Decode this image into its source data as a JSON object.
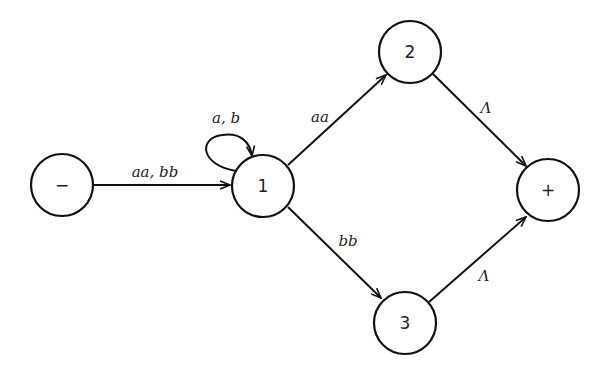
{
  "diagram": {
    "type": "finite automaton / transition graph",
    "nodes": [
      {
        "id": "start",
        "label": "−",
        "role": "start state"
      },
      {
        "id": "s1",
        "label": "1"
      },
      {
        "id": "s2",
        "label": "2"
      },
      {
        "id": "s3",
        "label": "3"
      },
      {
        "id": "final",
        "label": "+",
        "role": "final state"
      }
    ],
    "edges": [
      {
        "from": "start",
        "to": "s1",
        "label": "aa, bb"
      },
      {
        "from": "s1",
        "to": "s1",
        "label": "a, b",
        "loop": true
      },
      {
        "from": "s1",
        "to": "s2",
        "label": "aa"
      },
      {
        "from": "s1",
        "to": "s3",
        "label": "bb"
      },
      {
        "from": "s2",
        "to": "final",
        "label": "Λ"
      },
      {
        "from": "s3",
        "to": "final",
        "label": "Λ"
      }
    ]
  }
}
